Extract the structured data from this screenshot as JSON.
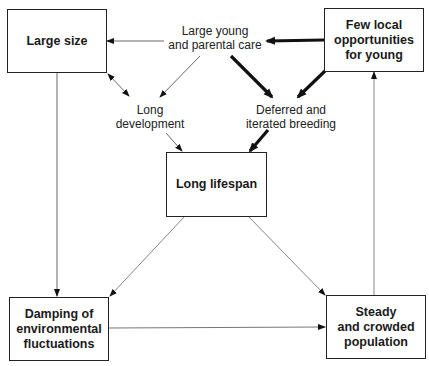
{
  "boxes": {
    "large_size": "Large size",
    "few_local": "Few local\nopportunities\nfor young",
    "long_lifespan": "Long lifespan",
    "damping": "Damping of\nenvironmental\nfluctuations",
    "steady": "Steady\nand crowded\npopulation"
  },
  "labels": {
    "large_young": "Large young\nand parental care",
    "long_development": "Long\ndevelopment",
    "deferred": "Deferred and\niterated breeding"
  },
  "edges": [
    {
      "from": "Large young and parental care",
      "to": "Large size",
      "weight": "thin"
    },
    {
      "from": "Large young and parental care",
      "to": "Long development",
      "weight": "thin"
    },
    {
      "from": "Large young and parental care",
      "to": "Deferred and iterated breeding",
      "weight": "thick"
    },
    {
      "from": "Few local opportunities for young",
      "to": "Large young and parental care",
      "weight": "thick"
    },
    {
      "from": "Few local opportunities for young",
      "to": "Deferred and iterated breeding",
      "weight": "thick"
    },
    {
      "from": "Large size",
      "to": "Long development",
      "weight": "thin",
      "bidirectional": true
    },
    {
      "from": "Long development",
      "to": "Long lifespan",
      "weight": "thin"
    },
    {
      "from": "Deferred and iterated breeding",
      "to": "Long lifespan",
      "weight": "thick"
    },
    {
      "from": "Large size",
      "to": "Damping of environmental fluctuations",
      "weight": "thin"
    },
    {
      "from": "Long lifespan",
      "to": "Damping of environmental fluctuations",
      "weight": "thin"
    },
    {
      "from": "Long lifespan",
      "to": "Steady and crowded population",
      "weight": "thin"
    },
    {
      "from": "Damping of environmental fluctuations",
      "to": "Steady and crowded population",
      "weight": "thin"
    },
    {
      "from": "Steady and crowded population",
      "to": "Few local opportunities for young",
      "weight": "thin"
    }
  ]
}
